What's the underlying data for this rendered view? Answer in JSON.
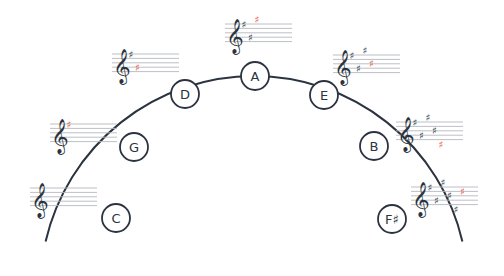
{
  "diagram": {
    "type": "circle-of-fifths",
    "colors": {
      "line": "#2b3340",
      "staff": "#b5b8be",
      "new_sharp": "#e8523c",
      "background": "#ffffff"
    },
    "nodes": [
      {
        "label": "C",
        "cx": 116,
        "cy": 218,
        "sharps": 0
      },
      {
        "label": "G",
        "cx": 134,
        "cy": 147,
        "sharps": 1
      },
      {
        "label": "D",
        "cx": 185,
        "cy": 94,
        "sharps": 2
      },
      {
        "label": "A",
        "cx": 255,
        "cy": 76,
        "sharps": 3
      },
      {
        "label": "E",
        "cx": 324,
        "cy": 95,
        "sharps": 4
      },
      {
        "label": "B",
        "cx": 374,
        "cy": 146,
        "sharps": 5
      },
      {
        "label": "F♯",
        "cx": 392,
        "cy": 219,
        "sharps": 6
      }
    ],
    "staves": [
      {
        "key": "C",
        "x": 30,
        "y": 188,
        "sharps": 0
      },
      {
        "key": "G",
        "x": 50,
        "y": 124,
        "sharps": 1
      },
      {
        "key": "D",
        "x": 112,
        "y": 54,
        "sharps": 2
      },
      {
        "key": "A",
        "x": 225,
        "y": 24,
        "sharps": 3
      },
      {
        "key": "E",
        "x": 333,
        "y": 55,
        "sharps": 4
      },
      {
        "key": "B",
        "x": 396,
        "y": 122,
        "sharps": 5
      },
      {
        "key": "F♯",
        "x": 411,
        "y": 187,
        "sharps": 6
      }
    ],
    "sharp_symbol": "♯",
    "clef_symbol": "𝄞"
  }
}
